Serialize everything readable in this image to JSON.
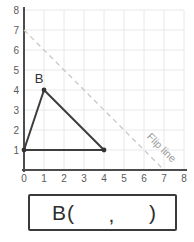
{
  "graph": {
    "axis_range": [
      0,
      8
    ],
    "x_ticks": [
      "0",
      "1",
      "2",
      "3",
      "4",
      "5",
      "6",
      "7",
      "8"
    ],
    "y_ticks": [
      "1",
      "2",
      "3",
      "4",
      "5",
      "6",
      "7",
      "8"
    ],
    "point_label": "B",
    "point_B": [
      1,
      4
    ],
    "triangle_vertices": [
      [
        0,
        1
      ],
      [
        1,
        4
      ],
      [
        4,
        1
      ]
    ],
    "flip_line": {
      "from": [
        0,
        7
      ],
      "to": [
        7,
        0
      ]
    },
    "flip_line_label": "Flip line",
    "colors": {
      "grid": "#e8e8e8",
      "axis": "#4d4d4d",
      "triangle": "#3d3d3d",
      "flip_line": "#c6c6c6",
      "flip_label": "#9c9c9c",
      "tick_text": "#5a5a5a"
    }
  },
  "answer_box": {
    "prefix": "B",
    "open_paren": "(",
    "comma": ",",
    "close_paren": ")"
  }
}
